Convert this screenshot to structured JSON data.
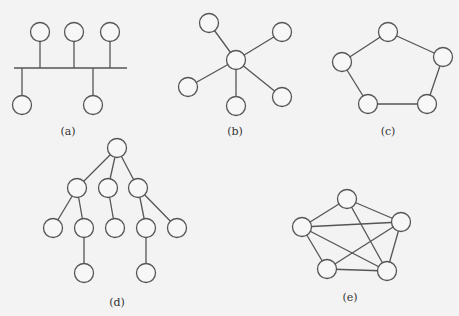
{
  "node_radius": 9.5,
  "colors": {
    "background": "#f3f3f3",
    "stroke": "#555555",
    "node_fill": "#f7f7f7"
  },
  "diagrams": [
    {
      "id": "a",
      "label": "(a)",
      "topology": "bus",
      "label_pos": [
        68,
        135
      ],
      "bus": [
        [
          14,
          68
        ],
        [
          127,
          68
        ]
      ],
      "nodes": [
        [
          40,
          32
        ],
        [
          74,
          32
        ],
        [
          110,
          32
        ],
        [
          22,
          105
        ],
        [
          93,
          105
        ]
      ],
      "taps": [
        [
          40,
          68
        ],
        [
          74,
          68
        ],
        [
          110,
          68
        ],
        [
          22,
          68
        ],
        [
          93,
          68
        ]
      ]
    },
    {
      "id": "b",
      "label": "(b)",
      "topology": "star",
      "label_pos": [
        235,
        135
      ],
      "nodes": [
        [
          236,
          60
        ],
        [
          209,
          23
        ],
        [
          282,
          32
        ],
        [
          188,
          87
        ],
        [
          236,
          106
        ],
        [
          282,
          97
        ]
      ],
      "edges": [
        [
          0,
          1
        ],
        [
          0,
          2
        ],
        [
          0,
          3
        ],
        [
          0,
          4
        ],
        [
          0,
          5
        ]
      ]
    },
    {
      "id": "c",
      "label": "(c)",
      "topology": "ring",
      "label_pos": [
        388,
        135
      ],
      "nodes": [
        [
          388,
          32
        ],
        [
          443,
          57
        ],
        [
          427,
          104
        ],
        [
          368,
          104
        ],
        [
          342,
          62
        ]
      ],
      "edges": [
        [
          0,
          1
        ],
        [
          1,
          2
        ],
        [
          2,
          3
        ],
        [
          3,
          4
        ],
        [
          4,
          0
        ]
      ]
    },
    {
      "id": "d",
      "label": "(d)",
      "topology": "tree",
      "label_pos": [
        117,
        306
      ],
      "nodes": [
        [
          117,
          148
        ],
        [
          77,
          188
        ],
        [
          108,
          188
        ],
        [
          138,
          188
        ],
        [
          53,
          228
        ],
        [
          84,
          228
        ],
        [
          115,
          228
        ],
        [
          146,
          228
        ],
        [
          177,
          228
        ],
        [
          84,
          273
        ],
        [
          146,
          273
        ]
      ],
      "edges": [
        [
          0,
          1
        ],
        [
          0,
          2
        ],
        [
          0,
          3
        ],
        [
          1,
          4
        ],
        [
          1,
          5
        ],
        [
          2,
          6
        ],
        [
          3,
          7
        ],
        [
          3,
          8
        ],
        [
          5,
          9
        ],
        [
          7,
          10
        ]
      ]
    },
    {
      "id": "e",
      "label": "(e)",
      "topology": "mesh",
      "label_pos": [
        350,
        301
      ],
      "nodes": [
        [
          347,
          199
        ],
        [
          401,
          222
        ],
        [
          387,
          271
        ],
        [
          327,
          269
        ],
        [
          302,
          227
        ]
      ],
      "edges": [
        [
          0,
          1
        ],
        [
          0,
          4
        ],
        [
          0,
          2
        ],
        [
          4,
          1
        ],
        [
          4,
          2
        ],
        [
          4,
          3
        ],
        [
          1,
          3
        ],
        [
          1,
          2
        ],
        [
          3,
          2
        ]
      ]
    }
  ]
}
